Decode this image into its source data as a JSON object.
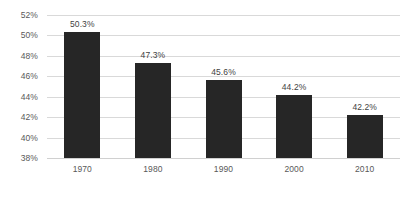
{
  "chart_data": {
    "type": "bar",
    "title": "",
    "subtitle": "",
    "xlabel": "",
    "ylabel": "",
    "categories": [
      "1970",
      "1980",
      "1990",
      "2000",
      "2010"
    ],
    "values": [
      50.3,
      47.3,
      45.6,
      44.2,
      42.2
    ],
    "data_labels": [
      "50.3%",
      "47.3%",
      "45.6%",
      "44.2%",
      "42.2%"
    ],
    "ylim": [
      38,
      52
    ],
    "ytick_values": [
      52,
      50,
      48,
      46,
      44,
      42,
      40,
      38
    ],
    "ytick_labels": [
      "52%",
      "50%",
      "48%",
      "46%",
      "44%",
      "42%",
      "40%",
      "38%"
    ],
    "grid": true,
    "legend": false,
    "legend_position": "none",
    "bar_color": "#262626",
    "gridline_color": "#d9d9d9",
    "background_color": "#ffffff",
    "axis_label_color": "#595959"
  }
}
